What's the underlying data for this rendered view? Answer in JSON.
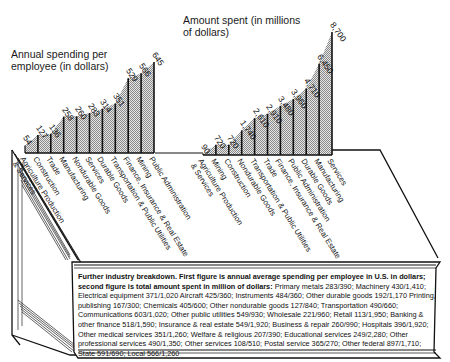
{
  "chart_data": [
    {
      "type": "area",
      "title": "Annual spending per employee (in dollars)",
      "xlabel": "",
      "ylabel": "Dollars per employee",
      "categories": [
        "Agriculture Production & Services",
        "Construction",
        "Trade",
        "Manufacturing",
        "Nondurable Goods",
        "Services",
        "Durable Goods",
        "Transportation & Public Utilities",
        "Finance, Insurance & Real Estate",
        "Mining",
        "Public Administration"
      ],
      "values": [
        54,
        127,
        136,
        258,
        260,
        283,
        314,
        351,
        529,
        566,
        645
      ],
      "ylim": [
        0,
        700
      ],
      "grid": false
    },
    {
      "type": "area",
      "title": "Amount spent (in millions of dollars)",
      "xlabel": "",
      "ylabel": "Millions of dollars",
      "categories": [
        "Agriculture Production & Services",
        "Mining",
        "Construction",
        "Nondurable Goods",
        "Transportation & Public Utilities",
        "Trade",
        "Finance, Insurance & Real Estate",
        "Public Administration",
        "Durable Goods",
        "Manufacturing",
        "Services"
      ],
      "values": [
        90,
        720,
        720,
        1740,
        2610,
        2910,
        3480,
        3960,
        4710,
        6450,
        8700
      ],
      "value_labels": [
        "90",
        "720",
        "720",
        "1,740",
        "2,610",
        "2,910",
        "3,480",
        "3,960",
        "4,710",
        "6,450",
        "8,700"
      ],
      "ylim": [
        0,
        9000
      ],
      "grid": false
    }
  ],
  "left_chart": {
    "title_line1": "Annual spending per",
    "title_line2": "employee (in dollars)",
    "value_labels": [
      "54",
      "127",
      "136",
      "258",
      "260",
      "283",
      "314",
      "351",
      "529",
      "566",
      "645"
    ],
    "values": [
      54,
      127,
      136,
      258,
      260,
      283,
      314,
      351,
      529,
      566,
      645
    ],
    "max": 645,
    "categories": [
      "Agriculture Production",
      "Construction",
      "Trade",
      "Manufacturing",
      "Nondurable Goods",
      "Services",
      "Durable Goods",
      "Transportation & Public Utilities",
      "Finance, Insurance & Real Estate",
      "Mining",
      "Public Administration"
    ],
    "category_sub": [
      "& Services",
      "",
      "",
      "",
      "",
      "",
      "",
      "",
      "",
      "",
      ""
    ]
  },
  "right_chart": {
    "title_line1": "Amount spent (in millions",
    "title_line2": "of dollars)",
    "value_labels": [
      "90",
      "720",
      "720",
      "1,740",
      "2,610",
      "2,910",
      "3,480",
      "3,960",
      "4,710",
      "6,450",
      "8,700"
    ],
    "values": [
      90,
      720,
      720,
      1740,
      2610,
      2910,
      3480,
      3960,
      4710,
      6450,
      8700
    ],
    "max": 8700,
    "categories": [
      "Agriculture Production",
      "Mining",
      "Construction",
      "Nondurable Goods",
      "Transportation & Public Utilities",
      "Trade",
      "Finance, Insurance & Real Estate",
      "Public Administration",
      "Durable Goods",
      "Manufacturing",
      "Services"
    ],
    "category_sub": [
      "& Services",
      "",
      "",
      "",
      "",
      "",
      "",
      "",
      "",
      "",
      ""
    ]
  },
  "footnote": {
    "heading": "Further industry breakdown. First figure is annual average spending per employee in U.S. in dollars; second figure is total amount spent in million of dollars:",
    "body": "Primary metals 283/390;   Machinery 430/1,410;   Electrical equipment 371/1,020   Aircraft 425/360;   Instruments 484/360;   Other durable goods 192/1,170   Printing, publishing 167/300;   Chemicals 405/600;   Other nondurable goods 127/840;   Transportation 490/660;   Communications 603/1,020;   Other public utilities 549/930;   Wholesale 221/960;   Retail 113/1,950;   Banking & other finance 518/1,590;   Insurance & real estate 549/1,920;   Business & repair 260/990;   Hospitals 396/1,920;   Other medical services 351/1,260;   Welfare & religious 207/390;   Educational services 249/2,280;   Other professional services 490/1,350;   Other services 108/510;   Postal service 365/270;   Other federal 897/1,710;   State 591/690;   Local 566/1,260",
    "entries": [
      {
        "name": "Primary metals",
        "per_employee": 283,
        "total_millions": 390
      },
      {
        "name": "Machinery",
        "per_employee": 430,
        "total_millions": 1410
      },
      {
        "name": "Electrical equipment",
        "per_employee": 371,
        "total_millions": 1020
      },
      {
        "name": "Aircraft",
        "per_employee": 425,
        "total_millions": 360
      },
      {
        "name": "Instruments",
        "per_employee": 484,
        "total_millions": 360
      },
      {
        "name": "Other durable goods",
        "per_employee": 192,
        "total_millions": 1170
      },
      {
        "name": "Printing, publishing",
        "per_employee": 167,
        "total_millions": 300
      },
      {
        "name": "Chemicals",
        "per_employee": 405,
        "total_millions": 600
      },
      {
        "name": "Other nondurable goods",
        "per_employee": 127,
        "total_millions": 840
      },
      {
        "name": "Transportation",
        "per_employee": 490,
        "total_millions": 660
      },
      {
        "name": "Communications",
        "per_employee": 603,
        "total_millions": 1020
      },
      {
        "name": "Other public utilities",
        "per_employee": 549,
        "total_millions": 930
      },
      {
        "name": "Wholesale",
        "per_employee": 221,
        "total_millions": 960
      },
      {
        "name": "Retail",
        "per_employee": 113,
        "total_millions": 1950
      },
      {
        "name": "Banking & other finance",
        "per_employee": 518,
        "total_millions": 1590
      },
      {
        "name": "Insurance & real estate",
        "per_employee": 549,
        "total_millions": 1920
      },
      {
        "name": "Business & repair",
        "per_employee": 260,
        "total_millions": 990
      },
      {
        "name": "Hospitals",
        "per_employee": 396,
        "total_millions": 1920
      },
      {
        "name": "Other medical services",
        "per_employee": 351,
        "total_millions": 1260
      },
      {
        "name": "Welfare & religious",
        "per_employee": 207,
        "total_millions": 390
      },
      {
        "name": "Educational services",
        "per_employee": 249,
        "total_millions": 2280
      },
      {
        "name": "Other professional services",
        "per_employee": 490,
        "total_millions": 1350
      },
      {
        "name": "Other services",
        "per_employee": 108,
        "total_millions": 510
      },
      {
        "name": "Postal service",
        "per_employee": 365,
        "total_millions": 270
      },
      {
        "name": "Other federal",
        "per_employee": 897,
        "total_millions": 1710
      },
      {
        "name": "State",
        "per_employee": 591,
        "total_millions": 690
      },
      {
        "name": "Local",
        "per_employee": 566,
        "total_millions": 1260
      }
    ]
  },
  "colors": {
    "ink": "#111111",
    "fill_pattern": "#bdbdbd",
    "background": "#ffffff"
  }
}
